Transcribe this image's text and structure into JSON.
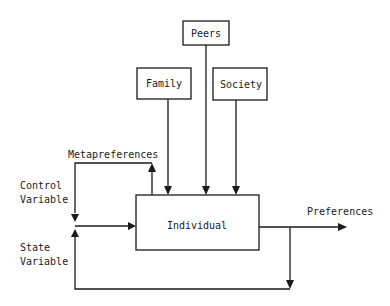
{
  "diagram": {
    "nodes": {
      "peers": "Peers",
      "family": "Family",
      "society": "Society",
      "individual": "Individual"
    },
    "labels": {
      "metapreferences": "Metapreferences",
      "control_line1": "Control",
      "control_line2": "Variable",
      "state_line1": "State",
      "state_line2": "Variable",
      "preferences": "Preferences"
    },
    "edges": [
      {
        "from": "Peers",
        "to": "Individual"
      },
      {
        "from": "Family",
        "to": "Individual"
      },
      {
        "from": "Society",
        "to": "Individual"
      },
      {
        "from": "Individual",
        "to": "Metapreferences"
      },
      {
        "from": "Metapreferences",
        "to": "Control Variable"
      },
      {
        "from": "Individual",
        "to": "Preferences"
      },
      {
        "from": "Preferences",
        "to": "State Variable"
      },
      {
        "from": "Control/State Variable",
        "to": "Individual"
      }
    ]
  }
}
